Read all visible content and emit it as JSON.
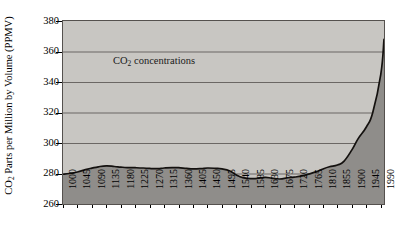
{
  "chart_data": {
    "type": "area",
    "title": "",
    "annotation": "CO2 concentrations",
    "annotation_html": "CO<sub>2</sub> concentrations",
    "xlabel": "",
    "ylabel": "CO2 Parts per Million by Volume (PPMV)",
    "ylabel_html": "CO<sub>2</sub> Parts per Million by Volume (PPMV)",
    "ylim": [
      260,
      380
    ],
    "ytick_labels": [
      "380",
      "360",
      "340",
      "320",
      "300",
      "280",
      "260"
    ],
    "ytick_values": [
      380,
      360,
      340,
      320,
      300,
      280,
      260
    ],
    "xlim": [
      1000,
      2000
    ],
    "xtick_labels": [
      "1000",
      "1045",
      "1090",
      "1135",
      "1180",
      "1225",
      "1270",
      "1315",
      "1360",
      "1405",
      "1450",
      "1495",
      "1540",
      "1585",
      "1630",
      "1675",
      "1720",
      "1765",
      "1810",
      "1855",
      "1900",
      "1945",
      "1990"
    ],
    "xtick_values": [
      1000,
      1045,
      1090,
      1135,
      1180,
      1225,
      1270,
      1315,
      1360,
      1405,
      1450,
      1495,
      1540,
      1585,
      1630,
      1675,
      1720,
      1765,
      1810,
      1855,
      1900,
      1945,
      1990
    ],
    "grid": true,
    "grid_axis": "y",
    "legend": false,
    "series": [
      {
        "name": "CO2 concentrations",
        "x": [
          1000,
          1020,
          1045,
          1070,
          1090,
          1110,
          1135,
          1160,
          1180,
          1200,
          1225,
          1250,
          1270,
          1295,
          1315,
          1340,
          1360,
          1385,
          1405,
          1430,
          1450,
          1475,
          1495,
          1520,
          1540,
          1560,
          1585,
          1605,
          1630,
          1650,
          1675,
          1700,
          1720,
          1745,
          1765,
          1790,
          1810,
          1830,
          1855,
          1875,
          1900,
          1920,
          1945,
          1965,
          1990,
          2000
        ],
        "y": [
          279.5,
          280.0,
          281.0,
          282.5,
          283.5,
          284.4,
          285.0,
          284.6,
          284.2,
          283.9,
          283.8,
          283.6,
          283.3,
          283.2,
          283.6,
          283.9,
          283.8,
          283.3,
          283.0,
          283.2,
          283.6,
          283.4,
          283.0,
          281.6,
          279.0,
          277.3,
          276.6,
          276.8,
          277.4,
          277.0,
          276.4,
          277.2,
          277.6,
          278.4,
          279.6,
          281.2,
          283.0,
          284.4,
          285.6,
          288.0,
          295.5,
          303.0,
          310.5,
          320.0,
          345.0,
          368.0
        ]
      }
    ],
    "area_fill_color": "#8f8d8a",
    "plot_background_color": "#c8c6c2",
    "line_color": "#14110f",
    "gridline_color": "#6b6764",
    "axis_color": "#55514e"
  }
}
